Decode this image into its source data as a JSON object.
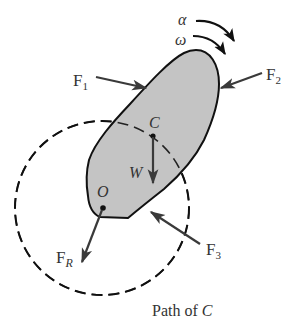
{
  "diagram": {
    "type": "rigid-body-rotation-free-body-diagram",
    "colors": {
      "body_fill": "#c4c4c4",
      "stroke": "#111111",
      "arrow": "#3a3a3a",
      "text": "#333333"
    },
    "labels": {
      "alpha": "α",
      "omega": "ω",
      "f1_main": "F",
      "f1_sub": "1",
      "f2_main": "F",
      "f2_sub": "2",
      "f3_main": "F",
      "f3_sub": "3",
      "fr_main": "F",
      "fr_sub": "R",
      "center_of_mass": "C",
      "pivot": "O",
      "weight": "W",
      "path_prefix": "Path of ",
      "path_var": "C"
    }
  }
}
